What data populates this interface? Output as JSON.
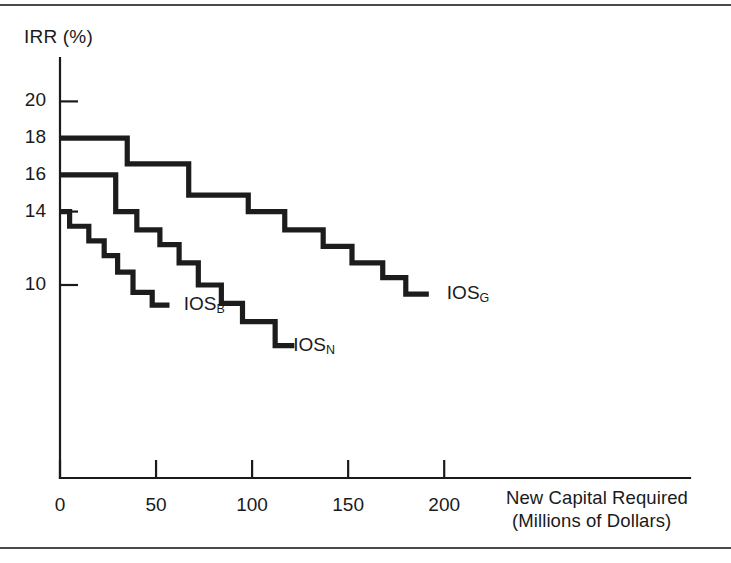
{
  "figure": {
    "background_color": "#ffffff",
    "line_color": "#1c1c1c",
    "frame_color": "#4a4a4a"
  },
  "chart_data": {
    "type": "line",
    "title": "",
    "xlabel": "New Capital Required",
    "xlabel_units": "(Millions of Dollars)",
    "ylabel": "IRR (%)",
    "xlim": [
      0,
      230
    ],
    "ylim": [
      5,
      21
    ],
    "grid": false,
    "legend_position": "inline-end-of-line",
    "xticks": [
      0,
      50,
      100,
      150,
      200
    ],
    "xtick_labels": [
      "0",
      "50",
      "100",
      "150",
      "200"
    ],
    "yticks": [
      10,
      14,
      16,
      18,
      20
    ],
    "ytick_labels": [
      "10",
      "14",
      "16",
      "18",
      "20"
    ],
    "step_style": "post",
    "series": [
      {
        "name": "IOS_G",
        "label_text": "IOS",
        "label_sub": "G",
        "label_x": 192,
        "label_y": 9.5,
        "description": "Good economy investment opportunity schedule",
        "steps": [
          {
            "x_start": 0,
            "x_end": 35,
            "irr": 18.0
          },
          {
            "x_start": 35,
            "x_end": 67,
            "irr": 16.6
          },
          {
            "x_start": 67,
            "x_end": 98,
            "irr": 14.9
          },
          {
            "x_start": 98,
            "x_end": 117,
            "irr": 14.0
          },
          {
            "x_start": 117,
            "x_end": 137,
            "irr": 13.0
          },
          {
            "x_start": 137,
            "x_end": 152,
            "irr": 12.1
          },
          {
            "x_start": 152,
            "x_end": 168,
            "irr": 11.2
          },
          {
            "x_start": 168,
            "x_end": 180,
            "irr": 10.4
          },
          {
            "x_start": 180,
            "x_end": 192,
            "irr": 9.5
          }
        ]
      },
      {
        "name": "IOS_N",
        "label_text": "IOS",
        "label_sub": "N",
        "label_x": 112,
        "label_y": 6.7,
        "description": "Normal economy investment opportunity schedule",
        "steps": [
          {
            "x_start": 0,
            "x_end": 29,
            "irr": 16.0
          },
          {
            "x_start": 29,
            "x_end": 40,
            "irr": 14.0
          },
          {
            "x_start": 40,
            "x_end": 52,
            "irr": 13.0
          },
          {
            "x_start": 52,
            "x_end": 62,
            "irr": 12.2
          },
          {
            "x_start": 62,
            "x_end": 72,
            "irr": 11.2
          },
          {
            "x_start": 72,
            "x_end": 84,
            "irr": 10.0
          },
          {
            "x_start": 84,
            "x_end": 95,
            "irr": 9.0
          },
          {
            "x_start": 95,
            "x_end": 112,
            "irr": 8.0
          },
          {
            "x_start": 112,
            "x_end": 122,
            "irr": 6.7
          }
        ]
      },
      {
        "name": "IOS_B",
        "label_text": "IOS",
        "label_sub": "B",
        "label_x": 55,
        "label_y": 8.9,
        "description": "Bad economy investment opportunity schedule",
        "steps": [
          {
            "x_start": 0,
            "x_end": 5,
            "irr": 14.0
          },
          {
            "x_start": 5,
            "x_end": 15,
            "irr": 13.2
          },
          {
            "x_start": 15,
            "x_end": 23,
            "irr": 12.4
          },
          {
            "x_start": 23,
            "x_end": 30,
            "irr": 11.6
          },
          {
            "x_start": 30,
            "x_end": 38,
            "irr": 10.7
          },
          {
            "x_start": 38,
            "x_end": 48,
            "irr": 9.6
          },
          {
            "x_start": 48,
            "x_end": 57,
            "irr": 8.9
          }
        ]
      }
    ]
  },
  "axis": {
    "y_title": "IRR (%)",
    "x_title_line1": "New Capital Required",
    "x_title_line2": "(Millions of Dollars)",
    "y_ticks": [
      {
        "value": 20,
        "label": "20"
      },
      {
        "value": 18,
        "label": "18"
      },
      {
        "value": 16,
        "label": "16"
      },
      {
        "value": 14,
        "label": "14"
      },
      {
        "value": 10,
        "label": "10"
      }
    ],
    "x_ticks": [
      {
        "value": 0,
        "label": "0"
      },
      {
        "value": 50,
        "label": "50"
      },
      {
        "value": 100,
        "label": "100"
      },
      {
        "value": 150,
        "label": "150"
      },
      {
        "value": 200,
        "label": "200"
      }
    ]
  },
  "series_labels": [
    {
      "name": "IOS_G",
      "text": "IOS",
      "sub": "G"
    },
    {
      "name": "IOS_N",
      "text": "IOS",
      "sub": "N"
    },
    {
      "name": "IOS_B",
      "text": "IOS",
      "sub": "B"
    }
  ]
}
